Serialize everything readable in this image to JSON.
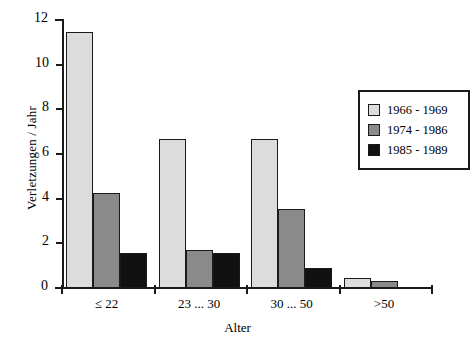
{
  "chart_data": {
    "type": "bar",
    "title": "",
    "subtitle": "",
    "xlabel": "Alter",
    "ylabel": "Verletzungen / Jahr",
    "categories": [
      "≤ 22",
      "23 ... 30",
      "30 ... 50",
      ">50"
    ],
    "series": [
      {
        "name": "1966 - 1969",
        "color": "#dcdcdc",
        "values": [
          11.45,
          6.65,
          6.65,
          0.45
        ]
      },
      {
        "name": "1974 - 1986",
        "color": "#8a8a8a",
        "values": [
          4.25,
          1.7,
          3.55,
          0.3
        ]
      },
      {
        "name": "1985 - 1989",
        "color": "#111111",
        "values": [
          1.55,
          1.55,
          0.9,
          0
        ]
      }
    ],
    "ylim": [
      0,
      12
    ],
    "yticks": [
      0,
      2,
      4,
      6,
      8,
      10,
      12
    ],
    "ytick_labels": [
      "0",
      "2",
      "4",
      "6",
      "8",
      "10",
      "12"
    ],
    "grid": false,
    "legend_position": "right"
  },
  "legend": {
    "items": [
      {
        "label": "1966 - 1969",
        "color": "#dcdcdc"
      },
      {
        "label": "1974 - 1986",
        "color": "#8a8a8a"
      },
      {
        "label": "1985 - 1989",
        "color": "#111111"
      }
    ]
  },
  "axes": {
    "y_title": "Verletzungen / Jahr",
    "x_title": "Alter"
  },
  "colors": {
    "axis": "#1a1a1a",
    "background": "#ffffff",
    "series_light": "#dcdcdc",
    "series_mid": "#8a8a8a",
    "series_dark": "#111111"
  }
}
